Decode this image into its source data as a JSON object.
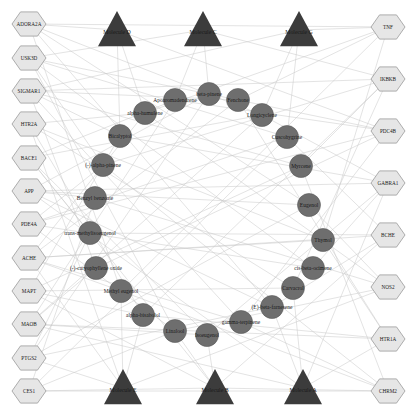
{
  "colors": {
    "background": "#ffffff",
    "edge": "#c8c8c8",
    "target_fill": "#e6e6e6",
    "target_stroke": "#9a9a9a",
    "compound_fill": "#6e6e6e",
    "compound_stroke": "#5a5a5a",
    "molecule_fill": "#3c3c3c"
  },
  "targets_left": [
    {
      "label": "ADORA2A",
      "x": 29,
      "y": 24
    },
    {
      "label": "USK3D",
      "x": 29,
      "y": 58
    },
    {
      "label": "SIGMAR1",
      "x": 29,
      "y": 91
    },
    {
      "label": "HTR2A",
      "x": 29,
      "y": 124
    },
    {
      "label": "BACE1",
      "x": 29,
      "y": 158
    },
    {
      "label": "APP",
      "x": 29,
      "y": 191
    },
    {
      "label": "PDE4A",
      "x": 29,
      "y": 224
    },
    {
      "label": "ACHE",
      "x": 29,
      "y": 258
    },
    {
      "label": "MAPT",
      "x": 29,
      "y": 291
    },
    {
      "label": "MAOB",
      "x": 29,
      "y": 324
    },
    {
      "label": "PTGS2",
      "x": 29,
      "y": 358
    },
    {
      "label": "CES1",
      "x": 29,
      "y": 391
    }
  ],
  "targets_right": [
    {
      "label": "TNF",
      "x": 388,
      "y": 27
    },
    {
      "label": "IKBKB",
      "x": 388,
      "y": 79
    },
    {
      "label": "PDC4B",
      "x": 388,
      "y": 131
    },
    {
      "label": "GABRA1",
      "x": 388,
      "y": 183
    },
    {
      "label": "BCHE",
      "x": 388,
      "y": 235
    },
    {
      "label": "NOS2",
      "x": 388,
      "y": 287
    },
    {
      "label": "HTR1A",
      "x": 388,
      "y": 339
    },
    {
      "label": "CHRM2",
      "x": 388,
      "y": 391
    }
  ],
  "molecules": [
    {
      "label": "Molecule D",
      "x": 117,
      "y": 30
    },
    {
      "label": "Molecule C",
      "x": 203,
      "y": 30
    },
    {
      "label": "Molecule G",
      "x": 299,
      "y": 30
    },
    {
      "label": "Molecule E",
      "x": 123,
      "y": 388
    },
    {
      "label": "Molecule B",
      "x": 215,
      "y": 388
    },
    {
      "label": "Molecule A",
      "x": 303,
      "y": 388
    }
  ],
  "compounds": [
    {
      "label": "beta-pinene",
      "x": 209,
      "y": 94
    },
    {
      "label": "Fenchone",
      "x": 238,
      "y": 100
    },
    {
      "label": "Longicyclene",
      "x": 262,
      "y": 115
    },
    {
      "label": "Cuscohygrine",
      "x": 287,
      "y": 137
    },
    {
      "label": "Myrcene",
      "x": 301,
      "y": 166
    },
    {
      "label": "Eugenol",
      "x": 309,
      "y": 205
    },
    {
      "label": "Thymol",
      "x": 323,
      "y": 240
    },
    {
      "label": "cis-beta-ocimene",
      "x": 313,
      "y": 268
    },
    {
      "label": "Carvacrol",
      "x": 293,
      "y": 288
    },
    {
      "label": "(E)-beta-farnesene",
      "x": 272,
      "y": 307
    },
    {
      "label": "gamma-terpinene",
      "x": 241,
      "y": 322
    },
    {
      "label": "Isoeugenol",
      "x": 207,
      "y": 335
    },
    {
      "label": "Linalool",
      "x": 175,
      "y": 331
    },
    {
      "label": "alpha-bisabolol",
      "x": 143,
      "y": 315
    },
    {
      "label": "Methyl eugenol",
      "x": 121,
      "y": 291
    },
    {
      "label": "(-)-caryophyllene oxide",
      "x": 96,
      "y": 268
    },
    {
      "label": "trans-methylisoeugenol",
      "x": 90,
      "y": 233
    },
    {
      "label": "Benzyl benzoate",
      "x": 95,
      "y": 198
    },
    {
      "label": "(-)-alpha-pinene",
      "x": 103,
      "y": 165
    },
    {
      "label": "Bicalyptol",
      "x": 120,
      "y": 136
    },
    {
      "label": "alpha-humulene",
      "x": 145,
      "y": 113
    },
    {
      "label": "Apoaromadendrene",
      "x": 175,
      "y": 100
    }
  ],
  "edges": [
    [
      "L0",
      "C2"
    ],
    [
      "L0",
      "C5"
    ],
    [
      "L0",
      "C9"
    ],
    [
      "L0",
      "C14"
    ],
    [
      "L0",
      "M0"
    ],
    [
      "L1",
      "C0"
    ],
    [
      "L1",
      "C3"
    ],
    [
      "L1",
      "C7"
    ],
    [
      "L1",
      "C12"
    ],
    [
      "L1",
      "C18"
    ],
    [
      "L1",
      "M1"
    ],
    [
      "L2",
      "C1"
    ],
    [
      "L2",
      "C4"
    ],
    [
      "L2",
      "C10"
    ],
    [
      "L2",
      "C15"
    ],
    [
      "L2",
      "C19"
    ],
    [
      "L2",
      "M2"
    ],
    [
      "L3",
      "C6"
    ],
    [
      "L3",
      "C8"
    ],
    [
      "L3",
      "C13"
    ],
    [
      "L3",
      "C20"
    ],
    [
      "L3",
      "M3"
    ],
    [
      "L4",
      "C2"
    ],
    [
      "L4",
      "C11"
    ],
    [
      "L4",
      "C16"
    ],
    [
      "L4",
      "C21"
    ],
    [
      "L4",
      "M4"
    ],
    [
      "L5",
      "C0"
    ],
    [
      "L5",
      "C5"
    ],
    [
      "L5",
      "C9"
    ],
    [
      "L5",
      "C17"
    ],
    [
      "L5",
      "M5"
    ],
    [
      "L6",
      "C3"
    ],
    [
      "L6",
      "C7"
    ],
    [
      "L6",
      "C12"
    ],
    [
      "L6",
      "C18"
    ],
    [
      "L6",
      "R2"
    ],
    [
      "L7",
      "C1"
    ],
    [
      "L7",
      "C6"
    ],
    [
      "L7",
      "C10"
    ],
    [
      "L7",
      "C14"
    ],
    [
      "L7",
      "C20"
    ],
    [
      "L7",
      "M3"
    ],
    [
      "L8",
      "C4"
    ],
    [
      "L8",
      "C8"
    ],
    [
      "L8",
      "C13"
    ],
    [
      "L8",
      "C19"
    ],
    [
      "L8",
      "M4"
    ],
    [
      "L9",
      "C2"
    ],
    [
      "L9",
      "C11"
    ],
    [
      "L9",
      "C15"
    ],
    [
      "L9",
      "C21"
    ],
    [
      "L9",
      "M5"
    ],
    [
      "L10",
      "C0"
    ],
    [
      "L10",
      "C5"
    ],
    [
      "L10",
      "C9"
    ],
    [
      "L10",
      "C16"
    ],
    [
      "L10",
      "M3"
    ],
    [
      "L11",
      "C3"
    ],
    [
      "L11",
      "C12"
    ],
    [
      "L11",
      "C17"
    ],
    [
      "L11",
      "M4"
    ],
    [
      "R0",
      "C1"
    ],
    [
      "R0",
      "C6"
    ],
    [
      "R0",
      "C14"
    ],
    [
      "R0",
      "C20"
    ],
    [
      "R0",
      "M2"
    ],
    [
      "R1",
      "C4"
    ],
    [
      "R1",
      "C8"
    ],
    [
      "R1",
      "C13"
    ],
    [
      "R1",
      "C18"
    ],
    [
      "R1",
      "M1"
    ],
    [
      "R2",
      "C0"
    ],
    [
      "R2",
      "C10"
    ],
    [
      "R2",
      "C15"
    ],
    [
      "R2",
      "C21"
    ],
    [
      "R2",
      "M0"
    ],
    [
      "R3",
      "C2"
    ],
    [
      "R3",
      "C7"
    ],
    [
      "R3",
      "C11"
    ],
    [
      "R3",
      "C19"
    ],
    [
      "R3",
      "M5"
    ],
    [
      "R4",
      "C3"
    ],
    [
      "R4",
      "C9"
    ],
    [
      "R4",
      "C16"
    ],
    [
      "R4",
      "M4"
    ],
    [
      "R5",
      "C5"
    ],
    [
      "R5",
      "C12"
    ],
    [
      "R5",
      "C17"
    ],
    [
      "R5",
      "C20"
    ],
    [
      "R5",
      "M3"
    ],
    [
      "R6",
      "C1"
    ],
    [
      "R6",
      "C6"
    ],
    [
      "R6",
      "C13"
    ],
    [
      "R6",
      "M5"
    ],
    [
      "R7",
      "C4"
    ],
    [
      "R7",
      "C10"
    ],
    [
      "R7",
      "C14"
    ],
    [
      "R7",
      "C18"
    ],
    [
      "R7",
      "M4"
    ],
    [
      "M0",
      "C19"
    ],
    [
      "M0",
      "C20"
    ],
    [
      "M1",
      "C0"
    ],
    [
      "M1",
      "C21"
    ],
    [
      "M2",
      "C2"
    ],
    [
      "M2",
      "C3"
    ],
    [
      "M3",
      "C14"
    ],
    [
      "M3",
      "C13"
    ],
    [
      "M4",
      "C11"
    ],
    [
      "M4",
      "C12"
    ],
    [
      "M5",
      "C9"
    ],
    [
      "M5",
      "C8"
    ],
    [
      "L0",
      "R0"
    ],
    [
      "L2",
      "R1"
    ],
    [
      "L5",
      "R3"
    ],
    [
      "L7",
      "R4"
    ],
    [
      "L9",
      "R6"
    ],
    [
      "L11",
      "R7"
    ]
  ]
}
